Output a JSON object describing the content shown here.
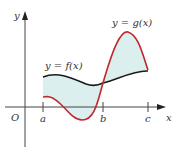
{
  "figure": {
    "labels": {
      "y_axis": "y",
      "x_axis": "x",
      "origin": "O",
      "tick_a": "a",
      "tick_b": "b",
      "tick_c": "c",
      "f_curve": "y = f(x)",
      "g_curve": "y = g(x)"
    },
    "colors": {
      "f_curve": "#1a1a1a",
      "g_curve": "#c0282d",
      "fill": "#dcefef",
      "axis": "#444444"
    }
  }
}
